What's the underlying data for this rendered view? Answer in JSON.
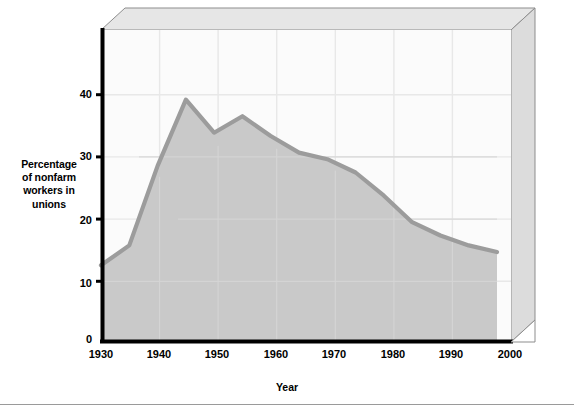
{
  "chart_data": {
    "type": "area",
    "title": "",
    "xlabel": "Year",
    "ylabel": "Percentage of nonfarm workers in unions",
    "ylabel_lines": [
      "Percentage",
      "of nonfarm",
      "workers in",
      "unions"
    ],
    "x": [
      1930,
      1935,
      1940,
      1945,
      1950,
      1955,
      1960,
      1965,
      1970,
      1975,
      1980,
      1985,
      1990,
      1995,
      2000
    ],
    "values": [
      11.5,
      14.5,
      26.5,
      36.5,
      31.5,
      34.0,
      31.0,
      28.5,
      27.5,
      25.5,
      22.0,
      18.0,
      16.0,
      14.5,
      13.5
    ],
    "xlim": [
      1930,
      2000
    ],
    "ylim": [
      0,
      47
    ],
    "xticks": [
      1930,
      1940,
      1950,
      1960,
      1970,
      1980,
      1990,
      2000
    ],
    "xtick_labels": [
      "1930",
      "1940",
      "1950",
      "1960",
      "1970",
      "1980",
      "1990",
      "2000"
    ],
    "yticks": [
      0,
      10,
      20,
      30,
      40
    ],
    "ytick_labels": [
      "0",
      "10",
      "20",
      "30",
      "40"
    ],
    "grid": true,
    "legend": "none",
    "style": "3d-area",
    "colors": {
      "area_fill": "#c9c9c9",
      "line": "#9c9c9c",
      "plot_background": "#fbfbfb",
      "gridline": "#ececec",
      "axis": "#000000",
      "frame_top": "#e4e4e4",
      "frame_side": "#d8d8d8",
      "frame_edge": "#8d8d8d",
      "rule": "#9a9a9a"
    }
  }
}
